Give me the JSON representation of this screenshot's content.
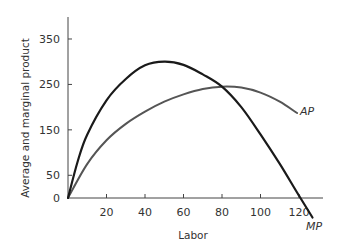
{
  "chart_data": {
    "type": "line",
    "title": "",
    "xlabel": "Labor",
    "ylabel": "Average and marginal product",
    "xlim": [
      0,
      130
    ],
    "ylim": [
      0,
      390
    ],
    "x_ticks": [
      20,
      40,
      60,
      80,
      100,
      120
    ],
    "y_ticks": [
      0,
      50,
      150,
      250,
      350
    ],
    "grid": false,
    "legend": "none (curves labeled directly)",
    "series": [
      {
        "name": "MP",
        "label": "MP",
        "color": "#1a1a1a",
        "x": [
          0,
          5,
          10,
          20,
          30,
          40,
          50,
          60,
          70,
          80,
          90,
          100,
          110,
          120,
          127
        ],
        "values": [
          0,
          80,
          140,
          215,
          262,
          292,
          300,
          293,
          272,
          245,
          200,
          140,
          75,
          5,
          -43
        ]
      },
      {
        "name": "AP",
        "label": "AP",
        "color": "#555555",
        "x": [
          0,
          10,
          20,
          30,
          40,
          50,
          60,
          70,
          80,
          90,
          100,
          110,
          119
        ],
        "values": [
          0,
          75,
          127,
          163,
          190,
          212,
          228,
          240,
          245,
          243,
          232,
          212,
          187
        ]
      }
    ]
  }
}
